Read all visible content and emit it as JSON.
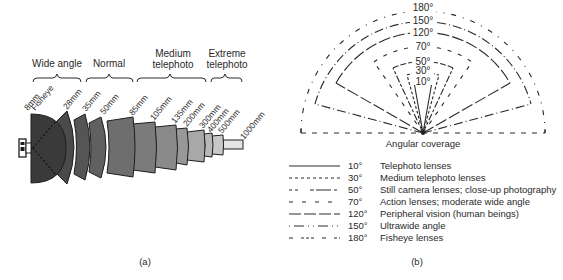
{
  "panel_a": {
    "caption": "(a)",
    "groups": [
      {
        "label_lines": [
          "Wide angle"
        ],
        "x1": 33,
        "x2": 81
      },
      {
        "label_lines": [
          "Normal"
        ],
        "x1": 86,
        "x2": 133
      },
      {
        "label_lines": [
          "Medium",
          "telephoto"
        ],
        "x1": 137,
        "x2": 206
      },
      {
        "label_lines": [
          "Extreme",
          "telephoto"
        ],
        "x1": 211,
        "x2": 243
      }
    ],
    "lenses": [
      {
        "focal_length": "8mm",
        "second_line": "Fisheye",
        "fill": "#3a3a3a"
      },
      {
        "focal_length": "28mm",
        "fill": "#4a4a4a"
      },
      {
        "focal_length": "35mm",
        "fill": "#555555"
      },
      {
        "focal_length": "50mm",
        "fill": "#606060"
      },
      {
        "focal_length": "85mm",
        "fill": "#6e6e6e"
      },
      {
        "focal_length": "105mm",
        "fill": "#7b7b7b"
      },
      {
        "focal_length": "135mm",
        "fill": "#8a8a8a"
      },
      {
        "focal_length": "200mm",
        "fill": "#989898"
      },
      {
        "focal_length": "300mm",
        "fill": "#a8a8a8"
      },
      {
        "focal_length": "400mm",
        "fill": "#b8b8b8"
      },
      {
        "focal_length": "500mm",
        "fill": "#c8c8c8"
      },
      {
        "focal_length": "1000mm",
        "fill": "#e4e4e4"
      }
    ],
    "camera_icon": "camera-icon"
  },
  "panel_b": {
    "caption": "(b)",
    "title": "Angular coverage",
    "arc_labels": [
      "180°",
      "150°",
      "120°",
      "70°",
      "50°",
      "30°",
      "10°"
    ],
    "legend": [
      {
        "angle": "10°",
        "description": "Telephoto lenses",
        "style": "solid"
      },
      {
        "angle": "30°",
        "description": "Medium telephoto lenses",
        "style": "dotted"
      },
      {
        "angle": "50°",
        "description": "Still camera lenses; close-up photography",
        "style": "dash-mixed"
      },
      {
        "angle": "70°",
        "description": "Action lenses; moderate wide angle",
        "style": "sparse-dash"
      },
      {
        "angle": "120°",
        "description": "Peripheral vision (human beings)",
        "style": "long-dash"
      },
      {
        "angle": "150°",
        "description": "Ultrawide angle",
        "style": "dash-dot"
      },
      {
        "angle": "180°",
        "description": "Fisheye lenses",
        "style": "dash-gap"
      }
    ]
  }
}
